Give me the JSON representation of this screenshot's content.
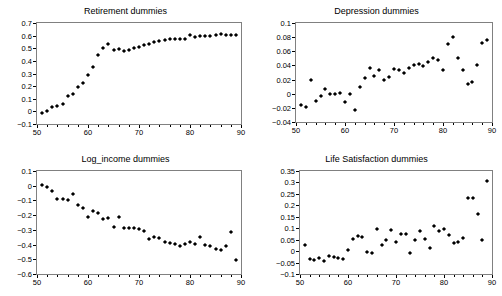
{
  "figure": {
    "width": 502,
    "height": 296,
    "background": "#ffffff",
    "marker_color": "#000000",
    "frame_color": "#808080",
    "marker_shape": "diamond"
  },
  "chart_data": [
    {
      "type": "scatter",
      "title": "Retirement dummies",
      "xlabel": "",
      "ylabel": "",
      "xlim": [
        50,
        90
      ],
      "ylim": [
        -0.1,
        0.7
      ],
      "grid": false,
      "legend": null,
      "xticks": [
        50,
        60,
        70,
        80,
        90
      ],
      "yticks": [
        -0.1,
        0,
        0.1,
        0.2,
        0.3,
        0.4,
        0.5,
        0.6,
        0.7
      ],
      "ytick_labels": [
        "-0.1",
        "0",
        "0.1",
        "0.2",
        "0.3",
        "0.4",
        "0.5",
        "0.6",
        "0.7"
      ],
      "xtick_labels": [
        "50",
        "60",
        "70",
        "80",
        "90"
      ],
      "x": [
        51,
        52,
        53,
        54,
        55,
        56,
        57,
        58,
        59,
        60,
        61,
        62,
        63,
        64,
        65,
        66,
        67,
        68,
        69,
        70,
        71,
        72,
        73,
        74,
        75,
        76,
        77,
        78,
        79,
        80,
        81,
        82,
        83,
        84,
        85,
        86,
        87,
        88,
        89
      ],
      "y": [
        -0.015,
        0.0,
        0.035,
        0.04,
        0.06,
        0.12,
        0.135,
        0.195,
        0.225,
        0.285,
        0.355,
        0.445,
        0.5,
        0.535,
        0.49,
        0.495,
        0.48,
        0.485,
        0.505,
        0.51,
        0.525,
        0.535,
        0.55,
        0.555,
        0.565,
        0.57,
        0.57,
        0.575,
        0.575,
        0.605,
        0.59,
        0.595,
        0.6,
        0.6,
        0.605,
        0.61,
        0.605,
        0.605,
        0.605
      ]
    },
    {
      "type": "scatter",
      "title": "Depression dummies",
      "xlabel": "",
      "ylabel": "",
      "xlim": [
        50,
        90
      ],
      "ylim": [
        -0.04,
        0.1
      ],
      "grid": false,
      "legend": null,
      "xticks": [
        50,
        60,
        70,
        80,
        90
      ],
      "yticks": [
        -0.04,
        -0.02,
        0,
        0.02,
        0.04,
        0.06,
        0.08,
        0.1
      ],
      "ytick_labels": [
        "-0.04",
        "-0.02",
        "0",
        "0.02",
        "0.04",
        "0.06",
        "0.08",
        "0.1"
      ],
      "xtick_labels": [
        "50",
        "60",
        "70",
        "80",
        "90"
      ],
      "x": [
        51,
        52,
        53,
        54,
        55,
        56,
        57,
        58,
        59,
        60,
        61,
        62,
        63,
        64,
        65,
        66,
        67,
        68,
        69,
        70,
        71,
        72,
        73,
        74,
        75,
        76,
        77,
        78,
        79,
        80,
        81,
        82,
        83,
        84,
        85,
        86,
        87,
        88,
        89
      ],
      "y": [
        -0.016,
        -0.019,
        0.02,
        -0.01,
        -0.003,
        0.006,
        -0.001,
        -0.001,
        0.001,
        -0.012,
        -0.001,
        -0.023,
        0.01,
        0.022,
        0.037,
        0.025,
        0.034,
        0.019,
        0.024,
        0.035,
        0.034,
        0.029,
        0.036,
        0.041,
        0.042,
        0.039,
        0.045,
        0.051,
        0.048,
        0.033,
        0.07,
        0.08,
        0.05,
        0.033,
        0.014,
        0.017,
        0.041,
        0.072,
        0.076
      ]
    },
    {
      "type": "scatter",
      "title": "Log_income dummies",
      "xlabel": "",
      "ylabel": "",
      "xlim": [
        50,
        90
      ],
      "ylim": [
        -0.6,
        0.1
      ],
      "grid": false,
      "legend": null,
      "xticks": [
        50,
        60,
        70,
        80,
        90
      ],
      "yticks": [
        -0.6,
        -0.5,
        -0.4,
        -0.3,
        -0.2,
        -0.1,
        0,
        0.1
      ],
      "ytick_labels": [
        "-0.6",
        "-0.5",
        "-0.4",
        "-0.3",
        "-0.2",
        "-0.1",
        "0",
        "0.1"
      ],
      "xtick_labels": [
        "50",
        "60",
        "70",
        "80",
        "90"
      ],
      "x": [
        51,
        52,
        53,
        54,
        55,
        56,
        57,
        58,
        59,
        60,
        61,
        62,
        63,
        64,
        65,
        66,
        67,
        68,
        69,
        70,
        71,
        72,
        73,
        74,
        75,
        76,
        77,
        78,
        79,
        80,
        81,
        82,
        83,
        84,
        85,
        86,
        87,
        88,
        89
      ],
      "y": [
        0.005,
        -0.01,
        -0.035,
        -0.09,
        -0.088,
        -0.1,
        -0.058,
        -0.13,
        -0.152,
        -0.21,
        -0.175,
        -0.188,
        -0.225,
        -0.218,
        -0.282,
        -0.215,
        -0.288,
        -0.288,
        -0.288,
        -0.292,
        -0.305,
        -0.36,
        -0.35,
        -0.355,
        -0.382,
        -0.392,
        -0.398,
        -0.412,
        -0.395,
        -0.382,
        -0.395,
        -0.348,
        -0.405,
        -0.41,
        -0.428,
        -0.438,
        -0.408,
        -0.312,
        -0.505
      ]
    },
    {
      "type": "scatter",
      "title": "Life Satisfaction dummies",
      "xlabel": "",
      "ylabel": "",
      "xlim": [
        50,
        90
      ],
      "ylim": [
        -0.1,
        0.35
      ],
      "grid": false,
      "legend": null,
      "xticks": [
        50,
        60,
        70,
        80,
        90
      ],
      "yticks": [
        -0.1,
        -0.05,
        0,
        0.05,
        0.1,
        0.15,
        0.2,
        0.25,
        0.3,
        0.35
      ],
      "ytick_labels": [
        "-0.1",
        "-0.05",
        "0",
        "0.05",
        "0.1",
        "0.15",
        "0.2",
        "0.25",
        "0.3",
        "0.35"
      ],
      "xtick_labels": [
        "50",
        "60",
        "70",
        "80",
        "90"
      ],
      "x": [
        51,
        52,
        53,
        54,
        55,
        56,
        57,
        58,
        59,
        60,
        61,
        62,
        63,
        64,
        65,
        66,
        67,
        68,
        69,
        70,
        71,
        72,
        73,
        74,
        75,
        76,
        77,
        78,
        79,
        80,
        81,
        82,
        83,
        84,
        85,
        86,
        87,
        88,
        89
      ],
      "y": [
        0.028,
        -0.033,
        -0.04,
        -0.03,
        -0.042,
        -0.022,
        -0.024,
        -0.028,
        -0.034,
        0.006,
        0.052,
        0.066,
        0.06,
        -0.003,
        -0.01,
        0.097,
        0.025,
        0.05,
        0.093,
        0.038,
        0.075,
        0.075,
        -0.008,
        0.05,
        0.09,
        0.055,
        0.015,
        0.111,
        0.09,
        0.098,
        0.072,
        0.036,
        0.04,
        0.058,
        0.232,
        0.233,
        0.162,
        0.047,
        0.305
      ]
    }
  ]
}
